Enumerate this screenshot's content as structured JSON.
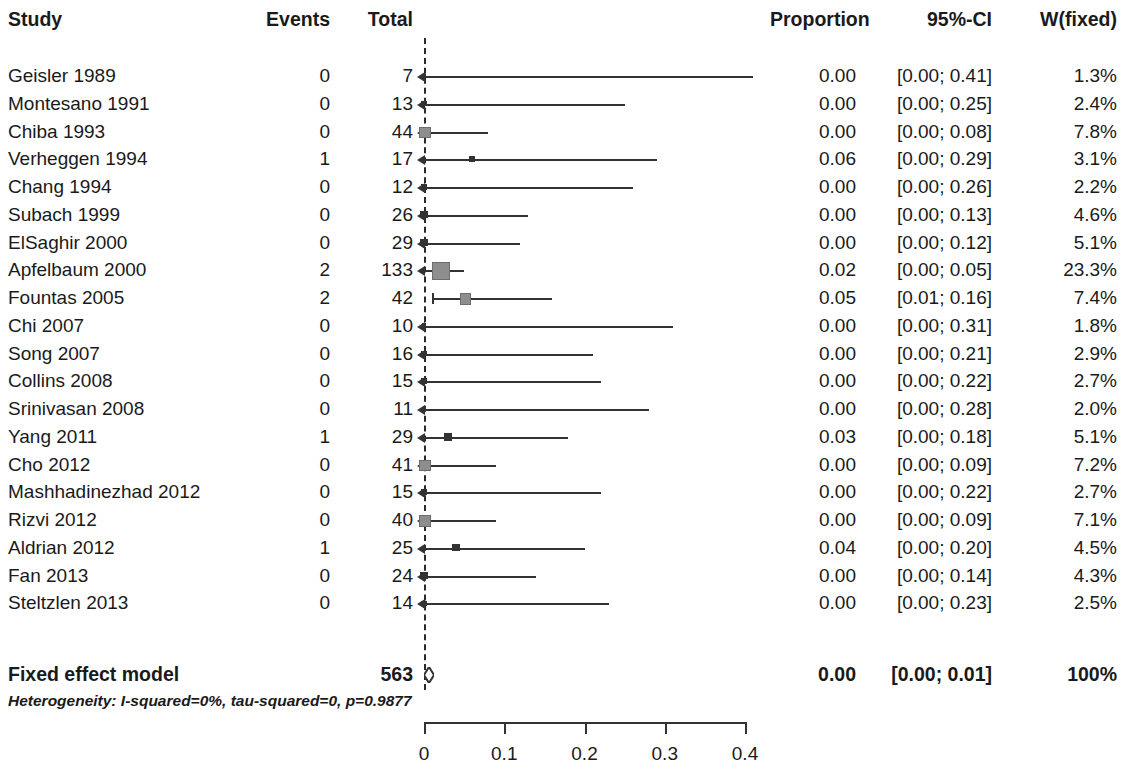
{
  "header": {
    "study": "Study",
    "events": "Events",
    "total": "Total",
    "proportion": "Proportion",
    "ci": "95%-CI",
    "weight": "W(fixed)"
  },
  "summary": {
    "label": "Fixed effect model",
    "events": "",
    "total": "563",
    "proportion": "0.00",
    "ci": "[0.00; 0.01]",
    "weight": "100%"
  },
  "heterogeneity": "Heterogeneity: I-squared=0%, tau-squared=0, p=0.9877",
  "colors": {
    "line": "#333333",
    "marker": "#8e8e8e",
    "text": "#1a1a1a"
  },
  "chart_data": {
    "type": "forest",
    "title": "",
    "xlabel": "",
    "ylabel": "",
    "xlim": [
      0,
      0.4
    ],
    "xticks": [
      0,
      0.1,
      0.2,
      0.3,
      0.4
    ],
    "xticklabels": [
      "0",
      "0.1",
      "0.2",
      "0.3",
      "0.4"
    ],
    "grid": false,
    "legend": "none",
    "effect_measure": "Proportion",
    "model": "Fixed effect model",
    "columns": [
      "Study",
      "Events",
      "Total",
      "Proportion",
      "95%-CI",
      "W(fixed)"
    ],
    "rows": [
      {
        "study": "Geisler 1989",
        "events": "0",
        "total": "7",
        "proportion": "0.00",
        "ci": "[0.00; 0.41]",
        "weight": "1.3%",
        "est": 0.0,
        "lo": 0.0,
        "hi": 0.41,
        "w": 1.3
      },
      {
        "study": "Montesano 1991",
        "events": "0",
        "total": "13",
        "proportion": "0.00",
        "ci": "[0.00; 0.25]",
        "weight": "2.4%",
        "est": 0.0,
        "lo": 0.0,
        "hi": 0.25,
        "w": 2.4
      },
      {
        "study": "Chiba 1993",
        "events": "0",
        "total": "44",
        "proportion": "0.00",
        "ci": "[0.00; 0.08]",
        "weight": "7.8%",
        "est": 0.0,
        "lo": 0.0,
        "hi": 0.08,
        "w": 7.8
      },
      {
        "study": "Verheggen 1994",
        "events": "1",
        "total": "17",
        "proportion": "0.06",
        "ci": "[0.00; 0.29]",
        "weight": "3.1%",
        "est": 0.06,
        "lo": 0.0,
        "hi": 0.29,
        "w": 3.1
      },
      {
        "study": "Chang 1994",
        "events": "0",
        "total": "12",
        "proportion": "0.00",
        "ci": "[0.00; 0.26]",
        "weight": "2.2%",
        "est": 0.0,
        "lo": 0.0,
        "hi": 0.26,
        "w": 2.2
      },
      {
        "study": "Subach 1999",
        "events": "0",
        "total": "26",
        "proportion": "0.00",
        "ci": "[0.00; 0.13]",
        "weight": "4.6%",
        "est": 0.0,
        "lo": 0.0,
        "hi": 0.13,
        "w": 4.6
      },
      {
        "study": "ElSaghir 2000",
        "events": "0",
        "total": "29",
        "proportion": "0.00",
        "ci": "[0.00; 0.12]",
        "weight": "5.1%",
        "est": 0.0,
        "lo": 0.0,
        "hi": 0.12,
        "w": 5.1
      },
      {
        "study": "Apfelbaum 2000",
        "events": "2",
        "total": "133",
        "proportion": "0.02",
        "ci": "[0.00; 0.05]",
        "weight": "23.3%",
        "est": 0.02,
        "lo": 0.0,
        "hi": 0.05,
        "w": 23.3
      },
      {
        "study": "Fountas 2005",
        "events": "2",
        "total": "42",
        "proportion": "0.05",
        "ci": "[0.01; 0.16]",
        "weight": "7.4%",
        "est": 0.05,
        "lo": 0.01,
        "hi": 0.16,
        "w": 7.4
      },
      {
        "study": "Chi 2007",
        "events": "0",
        "total": "10",
        "proportion": "0.00",
        "ci": "[0.00; 0.31]",
        "weight": "1.8%",
        "est": 0.0,
        "lo": 0.0,
        "hi": 0.31,
        "w": 1.8
      },
      {
        "study": "Song 2007",
        "events": "0",
        "total": "16",
        "proportion": "0.00",
        "ci": "[0.00; 0.21]",
        "weight": "2.9%",
        "est": 0.0,
        "lo": 0.0,
        "hi": 0.21,
        "w": 2.9
      },
      {
        "study": "Collins 2008",
        "events": "0",
        "total": "15",
        "proportion": "0.00",
        "ci": "[0.00; 0.22]",
        "weight": "2.7%",
        "est": 0.0,
        "lo": 0.0,
        "hi": 0.22,
        "w": 2.7
      },
      {
        "study": "Srinivasan 2008",
        "events": "0",
        "total": "11",
        "proportion": "0.00",
        "ci": "[0.00; 0.28]",
        "weight": "2.0%",
        "est": 0.0,
        "lo": 0.0,
        "hi": 0.28,
        "w": 2.0
      },
      {
        "study": "Yang 2011",
        "events": "1",
        "total": "29",
        "proportion": "0.03",
        "ci": "[0.00; 0.18]",
        "weight": "5.1%",
        "est": 0.03,
        "lo": 0.0,
        "hi": 0.18,
        "w": 5.1
      },
      {
        "study": "Cho 2012",
        "events": "0",
        "total": "41",
        "proportion": "0.00",
        "ci": "[0.00; 0.09]",
        "weight": "7.2%",
        "est": 0.0,
        "lo": 0.0,
        "hi": 0.09,
        "w": 7.2
      },
      {
        "study": "Mashhadinezhad 2012",
        "events": "0",
        "total": "15",
        "proportion": "0.00",
        "ci": "[0.00; 0.22]",
        "weight": "2.7%",
        "est": 0.0,
        "lo": 0.0,
        "hi": 0.22,
        "w": 2.7
      },
      {
        "study": "Rizvi 2012",
        "events": "0",
        "total": "40",
        "proportion": "0.00",
        "ci": "[0.00; 0.09]",
        "weight": "7.1%",
        "est": 0.0,
        "lo": 0.0,
        "hi": 0.09,
        "w": 7.1
      },
      {
        "study": "Aldrian 2012",
        "events": "1",
        "total": "25",
        "proportion": "0.04",
        "ci": "[0.00; 0.20]",
        "weight": "4.5%",
        "est": 0.04,
        "lo": 0.0,
        "hi": 0.2,
        "w": 4.5
      },
      {
        "study": "Fan 2013",
        "events": "0",
        "total": "24",
        "proportion": "0.00",
        "ci": "[0.00; 0.14]",
        "weight": "4.3%",
        "est": 0.0,
        "lo": 0.0,
        "hi": 0.14,
        "w": 4.3
      },
      {
        "study": "Steltzlen 2013",
        "events": "0",
        "total": "14",
        "proportion": "0.00",
        "ci": "[0.00; 0.23]",
        "weight": "2.5%",
        "est": 0.0,
        "lo": 0.0,
        "hi": 0.23,
        "w": 2.5
      }
    ],
    "summary_row": {
      "study": "Fixed effect model",
      "events": "",
      "total": "563",
      "proportion": "0.00",
      "ci": "[0.00; 0.01]",
      "weight": "100%",
      "est": 0.002,
      "lo": 0.0,
      "hi": 0.01
    }
  }
}
